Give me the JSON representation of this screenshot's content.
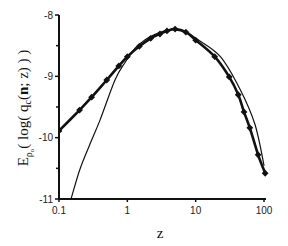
{
  "chart_data": {
    "type": "line",
    "title": "",
    "xlabel": "z",
    "ylabel": "E_ρ0( log( q_c(n; z) ) )",
    "ylabel_parts": {
      "E": "E",
      "sub": "ρ",
      "subsub": "o",
      "rest1": "( log( q",
      "c": "c",
      "rest2": "(",
      "n": "n",
      "rest3": "; z) ) )"
    },
    "xscale": "log",
    "xlim": [
      0.1,
      100
    ],
    "ylim": [
      -11,
      -8
    ],
    "x_ticks": [
      0.1,
      1,
      10,
      100
    ],
    "x_tick_labels": [
      "0.1",
      "1",
      "10",
      "100"
    ],
    "y_ticks": [
      -8,
      -9,
      -10,
      -11
    ],
    "y_tick_labels": [
      "-8",
      "-9",
      "-10",
      "-11"
    ],
    "y_minor_ticks": [
      -8.5,
      -9.5,
      -10.5
    ],
    "grid": false,
    "legend": null,
    "series": [
      {
        "name": "thick line with diamond markers",
        "style": "thick-diamond",
        "x": [
          0.1,
          0.2,
          0.3,
          0.5,
          0.75,
          1.0,
          1.5,
          2.2,
          3.0,
          3.8,
          5.0,
          7.2,
          10,
          19,
          31,
          42,
          51,
          62,
          82,
          104
        ],
        "y": [
          -9.89,
          -9.55,
          -9.34,
          -9.06,
          -8.83,
          -8.68,
          -8.51,
          -8.38,
          -8.31,
          -8.26,
          -8.23,
          -8.28,
          -8.41,
          -8.68,
          -9.01,
          -9.3,
          -9.58,
          -9.84,
          -10.28,
          -10.58
        ]
      },
      {
        "name": "thin line",
        "style": "thin",
        "x": [
          0.15,
          0.2,
          0.28,
          0.4,
          0.66,
          0.93,
          1.3,
          1.8,
          2.5,
          3.5,
          5.0,
          7.2,
          10,
          23,
          45,
          74,
          100
        ],
        "y": [
          -11.0,
          -10.53,
          -10.12,
          -9.71,
          -9.06,
          -8.77,
          -8.54,
          -8.41,
          -8.32,
          -8.26,
          -8.23,
          -8.27,
          -8.38,
          -8.68,
          -9.22,
          -9.79,
          -10.45
        ]
      }
    ]
  },
  "colors": {
    "line": "#111111",
    "axis": "#111111",
    "background": "#ffffff"
  }
}
